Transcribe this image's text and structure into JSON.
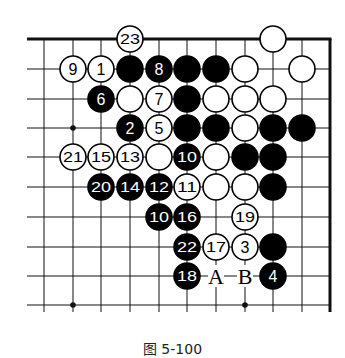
{
  "diagram": {
    "type": "go-board-fragment",
    "grid": {
      "columns_x": [
        44,
        73,
        101,
        130,
        159,
        187,
        216,
        245,
        273,
        302
      ],
      "rows_y": [
        39,
        69,
        99,
        128,
        157,
        187,
        217,
        247,
        276,
        305
      ],
      "left_extent": 27,
      "right_edge_x": 330,
      "top_edge_y": 39,
      "bottom_extent": 312,
      "top_edge_is_board_edge": true,
      "right_edge_is_board_edge": true
    },
    "colors": {
      "black": "#000000",
      "white": "#ffffff",
      "line": "#111111",
      "background": "#ffffff"
    },
    "star_points": [
      {
        "col": 1,
        "row": 3
      },
      {
        "col": 1,
        "row": 9
      },
      {
        "col": 7,
        "row": 9
      }
    ],
    "stones": [
      {
        "col": 3,
        "row": 0,
        "color": "white",
        "label": "23"
      },
      {
        "col": 8,
        "row": 0,
        "color": "white",
        "label": ""
      },
      {
        "col": 1,
        "row": 1,
        "color": "white",
        "label": "9"
      },
      {
        "col": 2,
        "row": 1,
        "color": "white",
        "label": "1"
      },
      {
        "col": 3,
        "row": 1,
        "color": "black",
        "label": ""
      },
      {
        "col": 4,
        "row": 1,
        "color": "black",
        "label": "8"
      },
      {
        "col": 5,
        "row": 1,
        "color": "black",
        "label": ""
      },
      {
        "col": 6,
        "row": 1,
        "color": "black",
        "label": ""
      },
      {
        "col": 7,
        "row": 1,
        "color": "white",
        "label": ""
      },
      {
        "col": 9,
        "row": 1,
        "color": "white",
        "label": ""
      },
      {
        "col": 2,
        "row": 2,
        "color": "black",
        "label": "6"
      },
      {
        "col": 3,
        "row": 2,
        "color": "white",
        "label": ""
      },
      {
        "col": 4,
        "row": 2,
        "color": "white",
        "label": "7"
      },
      {
        "col": 5,
        "row": 2,
        "color": "black",
        "label": ""
      },
      {
        "col": 6,
        "row": 2,
        "color": "white",
        "label": ""
      },
      {
        "col": 7,
        "row": 2,
        "color": "white",
        "label": ""
      },
      {
        "col": 8,
        "row": 2,
        "color": "white",
        "label": ""
      },
      {
        "col": 3,
        "row": 3,
        "color": "black",
        "label": "2"
      },
      {
        "col": 4,
        "row": 3,
        "color": "white",
        "label": "5"
      },
      {
        "col": 5,
        "row": 3,
        "color": "black",
        "label": ""
      },
      {
        "col": 6,
        "row": 3,
        "color": "black",
        "label": ""
      },
      {
        "col": 7,
        "row": 3,
        "color": "white",
        "label": ""
      },
      {
        "col": 8,
        "row": 3,
        "color": "black",
        "label": ""
      },
      {
        "col": 9,
        "row": 3,
        "color": "black",
        "label": ""
      },
      {
        "col": 1,
        "row": 4,
        "color": "white",
        "label": "21"
      },
      {
        "col": 2,
        "row": 4,
        "color": "white",
        "label": "15"
      },
      {
        "col": 3,
        "row": 4,
        "color": "white",
        "label": "13"
      },
      {
        "col": 4,
        "row": 4,
        "color": "white",
        "label": ""
      },
      {
        "col": 5,
        "row": 4,
        "color": "black",
        "label": "10"
      },
      {
        "col": 6,
        "row": 4,
        "color": "white",
        "label": ""
      },
      {
        "col": 7,
        "row": 4,
        "color": "black",
        "label": ""
      },
      {
        "col": 8,
        "row": 4,
        "color": "black",
        "label": ""
      },
      {
        "col": 2,
        "row": 5,
        "color": "black",
        "label": "20"
      },
      {
        "col": 3,
        "row": 5,
        "color": "black",
        "label": "14"
      },
      {
        "col": 4,
        "row": 5,
        "color": "black",
        "label": "12"
      },
      {
        "col": 5,
        "row": 5,
        "color": "white",
        "label": "11"
      },
      {
        "col": 6,
        "row": 5,
        "color": "white",
        "label": ""
      },
      {
        "col": 7,
        "row": 5,
        "color": "white",
        "label": ""
      },
      {
        "col": 8,
        "row": 5,
        "color": "black",
        "label": ""
      },
      {
        "col": 4,
        "row": 6,
        "color": "black",
        "label": "10"
      },
      {
        "col": 5,
        "row": 6,
        "color": "black",
        "label": "16"
      },
      {
        "col": 7,
        "row": 6,
        "color": "white",
        "label": "19"
      },
      {
        "col": 5,
        "row": 7,
        "color": "black",
        "label": "22"
      },
      {
        "col": 6,
        "row": 7,
        "color": "white",
        "label": "17"
      },
      {
        "col": 7,
        "row": 7,
        "color": "white",
        "label": "3"
      },
      {
        "col": 8,
        "row": 7,
        "color": "black",
        "label": ""
      },
      {
        "col": 5,
        "row": 8,
        "color": "black",
        "label": "18"
      },
      {
        "col": 8,
        "row": 8,
        "color": "black",
        "label": "4"
      }
    ],
    "letter_marks": [
      {
        "col": 6,
        "row": 8,
        "label": "A"
      },
      {
        "col": 7,
        "row": 8,
        "label": "B"
      }
    ]
  },
  "caption": {
    "text": "图 5-100"
  }
}
